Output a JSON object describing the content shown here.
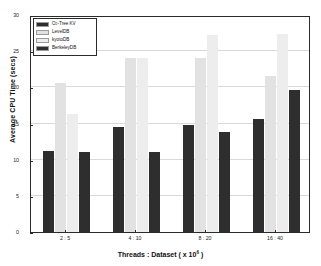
{
  "chart_data": {
    "type": "bar",
    "title": "",
    "xlabel": "Threads : Dataset ( x 10^6 )",
    "xlabel_prefix": "Threads : Dataset ( x 10",
    "xlabel_exponent": "6",
    "xlabel_suffix": " )",
    "ylabel": "Average CPU Time (secs)",
    "categories": [
      "2 : 5",
      "4 : 10",
      "8 : 20",
      "16 : 40"
    ],
    "ylim": [
      0,
      30
    ],
    "yticks": [
      "0",
      "5",
      "10",
      "15",
      "20",
      "25",
      "30"
    ],
    "ytick_values": [
      0,
      5,
      10,
      15,
      20,
      25,
      30
    ],
    "grid": true,
    "legend_position": "top-left",
    "series": [
      {
        "name": "O2-Tree KV",
        "name_base": "O",
        "name_sub": "2",
        "name_rest": "-Tree KV",
        "color": "#2e2e2e",
        "values": [
          11.2,
          14.5,
          14.8,
          15.6
        ]
      },
      {
        "name": "LevelDB",
        "color": "#e2e2e2",
        "values": [
          20.6,
          24.0,
          24.0,
          21.6
        ]
      },
      {
        "name": "kyotoDB",
        "color": "#ededed",
        "values": [
          16.3,
          24.0,
          27.2,
          27.4
        ]
      },
      {
        "name": "BerkeleyDB",
        "color": "#2e2e2e",
        "values": [
          11.0,
          11.1,
          13.8,
          19.6
        ]
      }
    ]
  },
  "figure": {
    "background": "#ffffff",
    "axis_color": "#2b2b2b",
    "grid_color": "#d9d9d9"
  }
}
